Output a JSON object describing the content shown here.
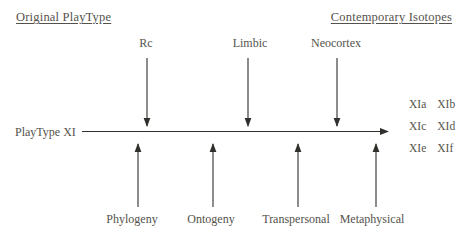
{
  "headings": {
    "left": "Original PlayType",
    "right": "Contemporary Isotopes"
  },
  "axis_label": "PlayType XI",
  "top_labels": [
    "Rc",
    "Limbic",
    "Neocortex"
  ],
  "bottom_labels": [
    "Phylogeny",
    "Ontogeny",
    "Transpersonal",
    "Metaphysical"
  ],
  "isotope_labels": [
    [
      "XIa",
      "XIb"
    ],
    [
      "XIc",
      "XId"
    ],
    [
      "XIe",
      "XIf"
    ]
  ],
  "colors": {
    "text": "#54524b",
    "line": "#2f2f2c",
    "background": "#ffffff"
  }
}
